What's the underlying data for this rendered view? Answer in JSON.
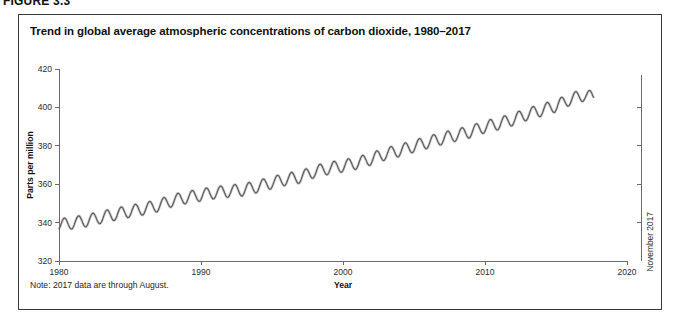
{
  "figure": {
    "label": "FIGURE 3.3"
  },
  "panel": {
    "title": "Trend in global average atmospheric concentrations of carbon dioxide, 1980–2017",
    "note": "Note: 2017 data are through August."
  },
  "annotation": {
    "right_axis_label": "November 2017"
  },
  "colors": {
    "line": "#555555",
    "line_halo": "#9a9a9a",
    "axis": "#6b6b6b",
    "border": "#3a3a3a",
    "text": "#1a1a1a",
    "background": "#ffffff"
  },
  "chart_data": {
    "type": "line",
    "title": "Trend in global average atmospheric concentrations of carbon dioxide, 1980–2017",
    "xlabel": "Year",
    "ylabel": "Parts per million",
    "xlim": [
      1980,
      2020
    ],
    "ylim": [
      320,
      420
    ],
    "xticks": [
      1980,
      1990,
      2000,
      2010,
      2020
    ],
    "xtick_labels": [
      "1980",
      "1990",
      "2000",
      "2010",
      "2020"
    ],
    "yticks": [
      320,
      340,
      360,
      380,
      400,
      420
    ],
    "ytick_labels": [
      "320",
      "340",
      "360",
      "380",
      "400",
      "420"
    ],
    "grid": false,
    "legend": null,
    "annotations": [
      {
        "text": "November 2017",
        "orientation": "vertical",
        "position": "right-axis"
      },
      {
        "text": "Note: 2017 data are through August.",
        "position": "below-plot"
      }
    ],
    "series": [
      {
        "name": "Global average atmospheric CO2 concentration",
        "units": "parts per million",
        "seasonal_oscillation": true,
        "seasonal_amplitude_ppm": 3.2,
        "x": [
          1980.0,
          1981.0,
          1982.0,
          1983.0,
          1984.0,
          1985.0,
          1986.0,
          1987.0,
          1988.0,
          1989.0,
          1990.0,
          1991.0,
          1992.0,
          1993.0,
          1994.0,
          1995.0,
          1996.0,
          1997.0,
          1998.0,
          1999.0,
          2000.0,
          2001.0,
          2002.0,
          2003.0,
          2004.0,
          2005.0,
          2006.0,
          2007.0,
          2008.0,
          2009.0,
          2010.0,
          2011.0,
          2012.0,
          2013.0,
          2014.0,
          2015.0,
          2016.0,
          2017.0,
          2017.67
        ],
        "values": [
          338.8,
          339.9,
          341.1,
          342.8,
          344.4,
          345.9,
          347.2,
          348.9,
          351.5,
          353.1,
          354.4,
          355.6,
          356.4,
          357.1,
          358.8,
          360.8,
          362.6,
          363.7,
          366.6,
          368.3,
          369.5,
          371.0,
          373.2,
          375.8,
          377.5,
          379.8,
          381.9,
          383.8,
          385.6,
          387.4,
          389.9,
          391.6,
          393.8,
          396.5,
          398.6,
          400.8,
          404.2,
          406.5,
          405.0
        ]
      }
    ]
  }
}
